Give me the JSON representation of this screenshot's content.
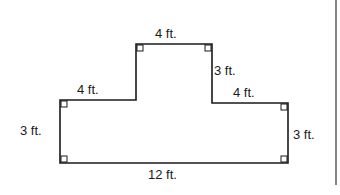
{
  "diagram": {
    "type": "composite rectilinear figure",
    "labels": {
      "top": "4 ft.",
      "right_upper": "3 ft.",
      "left_step": "4 ft.",
      "right_step": "4 ft.",
      "left_side": "3 ft.",
      "right_side": "3 ft.",
      "bottom": "12 ft."
    },
    "right_angle_markers": 6,
    "line_color": "#1a1a1a"
  }
}
